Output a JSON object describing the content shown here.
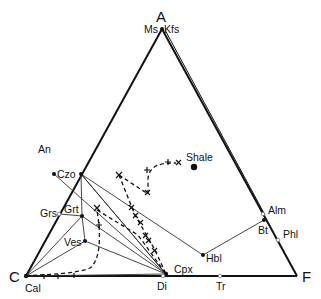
{
  "diagram": {
    "type": "ACF ternary phase diagram",
    "vertices": {
      "A": {
        "label": "A",
        "sublabel": "Ms, Kfs"
      },
      "C": {
        "label": "C",
        "sublabel": "Cal"
      },
      "F": {
        "label": "F"
      }
    },
    "labels": {
      "ms": "Ms",
      "kfs": "Kfs",
      "a": "A",
      "c": "C",
      "f": "F",
      "cal": "Cal",
      "an": "An",
      "czo": "Czo",
      "grs": "Grs",
      "grt": "Grt",
      "ves": "Ves",
      "shale": "Shale",
      "cpx": "Cpx",
      "di": "Di",
      "tr": "Tr",
      "hbl": "Hbl",
      "alm": "Alm",
      "bt": "Bt",
      "phl": "Phl"
    },
    "phases": [
      "An",
      "Czo",
      "Grs",
      "Grt",
      "Ves",
      "Cal",
      "Cpx",
      "Di",
      "Tr",
      "Hbl",
      "Bt",
      "Alm",
      "Phl",
      "Ms",
      "Kfs",
      "Shale"
    ],
    "colors": {
      "line": "#111111",
      "background": "#ffffff"
    }
  }
}
